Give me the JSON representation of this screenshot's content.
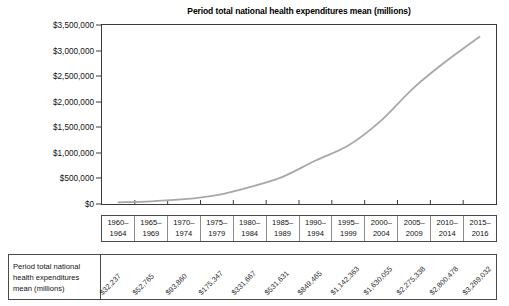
{
  "chart_data": {
    "type": "line",
    "title": "Period total national health expenditures mean (millions)",
    "xlabel": "",
    "ylabel": "",
    "grid": false,
    "legend": false,
    "ylim": [
      0,
      3500000
    ],
    "ytick_labels": [
      "$3,500,000",
      "$3,000,000",
      "$2,500,000",
      "$2,000,000",
      "$1,500,000",
      "$1,000,000",
      "$500,000",
      "$0"
    ],
    "ytick_values": [
      3500000,
      3000000,
      2500000,
      2000000,
      1500000,
      1000000,
      500000,
      0
    ],
    "categories": [
      "1960–\n1964",
      "1965–\n1969",
      "1970–\n1974",
      "1975–\n1979",
      "1980–\n1984",
      "1985–\n1989",
      "1990–\n1994",
      "1995–\n1999",
      "2000–\n2004",
      "2005–\n2009",
      "2010–\n2014",
      "2015–\n2016"
    ],
    "category_lines": [
      [
        "1960–",
        "1964"
      ],
      [
        "1965–",
        "1969"
      ],
      [
        "1970–",
        "1974"
      ],
      [
        "1975–",
        "1979"
      ],
      [
        "1980–",
        "1984"
      ],
      [
        "1985–",
        "1989"
      ],
      [
        "1990–",
        "1994"
      ],
      [
        "1995–",
        "1999"
      ],
      [
        "2000–",
        "2004"
      ],
      [
        "2005–",
        "2009"
      ],
      [
        "2010–",
        "2014"
      ],
      [
        "2015–",
        "2016"
      ]
    ],
    "values": [
      32237,
      52765,
      93860,
      175347,
      331667,
      531631,
      849465,
      1142363,
      1630055,
      2275338,
      2800478,
      3269032
    ],
    "value_labels": [
      "$32,237",
      "$52,765",
      "$93,860",
      "$175,347",
      "$331,667",
      "$531,631",
      "$849,465",
      "$1,142,363",
      "$1,630,055",
      "$2,275,338",
      "$2,800,478",
      "$3,269,032"
    ],
    "series_name": "Period total national health expenditures mean (millions)",
    "line_color": "#a8a8a8"
  },
  "table": {
    "row_label_lines": [
      "Period total national",
      "health expenditures",
      "mean (millions)"
    ],
    "row_label": "Period total national health expenditures mean (millions)"
  },
  "colors": {
    "line": "#a8a8a8",
    "axis": "#3a3a3a",
    "table_border": "#4a4a4a",
    "text": "#111111"
  }
}
